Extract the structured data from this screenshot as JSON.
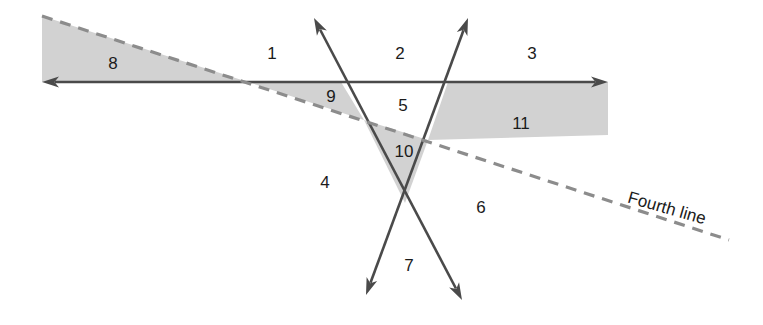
{
  "figure": {
    "background_color": "#ffffff",
    "shade_color": "#d2d2d2",
    "solid_line_color": "#4a4a4a",
    "dashed_line_color": "#8c8c8c",
    "label_color": "#1b1b1b"
  },
  "line_labels": [
    {
      "id": "fourth-line",
      "text": "Fourth line",
      "x": 628,
      "y": 198,
      "rotation": 16
    }
  ],
  "region_labels": [
    {
      "id": "region-1",
      "text": "1",
      "x": 272,
      "y": 55,
      "shaded": false
    },
    {
      "id": "region-2",
      "text": "2",
      "x": 400,
      "y": 55,
      "shaded": false
    },
    {
      "id": "region-3",
      "text": "3",
      "x": 532,
      "y": 55,
      "shaded": false
    },
    {
      "id": "region-4",
      "text": "4",
      "x": 325,
      "y": 184,
      "shaded": false
    },
    {
      "id": "region-5",
      "text": "5",
      "x": 403,
      "y": 107,
      "shaded": false
    },
    {
      "id": "region-6",
      "text": "6",
      "x": 481,
      "y": 209,
      "shaded": false
    },
    {
      "id": "region-7",
      "text": "7",
      "x": 409,
      "y": 267,
      "shaded": false
    },
    {
      "id": "region-8",
      "text": "8",
      "x": 113,
      "y": 65,
      "shaded": true
    },
    {
      "id": "region-9",
      "text": "9",
      "x": 331,
      "y": 98,
      "shaded": true
    },
    {
      "id": "region-10",
      "text": "10",
      "x": 404,
      "y": 153,
      "shaded": true
    },
    {
      "id": "region-11",
      "text": "11",
      "x": 521,
      "y": 125,
      "shaded": true
    }
  ],
  "lines": [
    {
      "id": "horizontal-line",
      "style": "solid",
      "x1": 42,
      "y1": 82,
      "x2": 608,
      "y2": 82,
      "arrow_start": true,
      "arrow_end": true
    },
    {
      "id": "left-slant-line",
      "style": "solid",
      "x1": 314,
      "y1": 18,
      "x2": 462,
      "y2": 300,
      "arrow_start": true,
      "arrow_end": true
    },
    {
      "id": "right-slant-line",
      "style": "solid",
      "x1": 468,
      "y1": 18,
      "x2": 366,
      "y2": 295,
      "arrow_start": true,
      "arrow_end": true
    },
    {
      "id": "fourth-line-dashed",
      "style": "dashed",
      "x1": 42,
      "y1": 16,
      "x2": 729,
      "y2": 240,
      "arrow_start": false,
      "arrow_end": false
    }
  ],
  "shaded_regions": [
    {
      "id": "shade-region-8",
      "points": "42,16 248,82 42,82"
    },
    {
      "id": "shade-region-9",
      "points": "248,82 341,82 364,120"
    },
    {
      "id": "shade-region-10",
      "points": "364,120 428,140 405,203"
    },
    {
      "id": "shade-region-11",
      "points": "448,82 608,82 608,135 428,140"
    }
  ],
  "intersections": [
    {
      "id": "dashed-meets-horizontal",
      "x": 248,
      "y": 82
    },
    {
      "id": "left-slant-meets-horizontal",
      "x": 341,
      "y": 82
    },
    {
      "id": "right-slant-meets-horizontal",
      "x": 448,
      "y": 82
    },
    {
      "id": "dashed-meets-left-slant",
      "x": 364,
      "y": 120
    },
    {
      "id": "dashed-meets-right-slant",
      "x": 428,
      "y": 140
    },
    {
      "id": "slants-cross",
      "x": 405,
      "y": 203
    }
  ]
}
